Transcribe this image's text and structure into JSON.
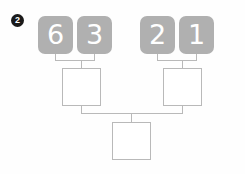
{
  "worksheet": {
    "problem_number": "2",
    "type": "number-pyramid-worksheet",
    "colors": {
      "tile_fill": "#b0b0b0",
      "tile_text": "#ffffff",
      "box_border": "#b9b9b9",
      "connector": "#b9b9b9",
      "bullet_fill": "#1a1a1a",
      "bullet_text": "#ffffff",
      "page_background": "#fefefe"
    },
    "tiles": [
      {
        "name": "tile-6",
        "value": "6"
      },
      {
        "name": "tile-3",
        "value": "3"
      },
      {
        "name": "tile-2",
        "value": "2"
      },
      {
        "name": "tile-1",
        "value": "1"
      }
    ],
    "answer_boxes": [
      {
        "name": "answer-box-middle-left",
        "value": ""
      },
      {
        "name": "answer-box-middle-right",
        "value": ""
      },
      {
        "name": "answer-box-bottom",
        "value": ""
      }
    ]
  }
}
